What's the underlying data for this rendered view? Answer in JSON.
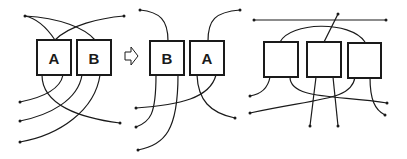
{
  "diagram": {
    "panels": [
      {
        "name": "before",
        "boxes": [
          {
            "label": "A"
          },
          {
            "label": "B"
          }
        ]
      },
      {
        "name": "after",
        "boxes": [
          {
            "label": "B"
          },
          {
            "label": "A"
          }
        ]
      },
      {
        "name": "three-box",
        "boxes": [
          {
            "label": ""
          },
          {
            "label": ""
          },
          {
            "label": ""
          }
        ]
      }
    ],
    "transition_arrow": "hollow-right-arrow",
    "colors": {
      "stroke": "#1a1a1a",
      "background": "#ffffff"
    }
  }
}
